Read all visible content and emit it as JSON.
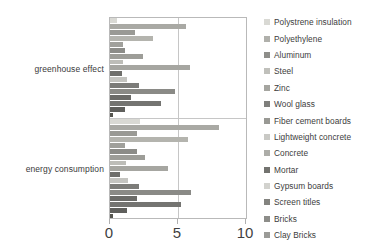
{
  "chart_data": {
    "type": "bar",
    "orientation": "horizontal",
    "title": "",
    "xlabel": "",
    "ylabel": "",
    "categories": [
      "greenhouse effect",
      "energy consumption"
    ],
    "xlim": [
      0,
      10
    ],
    "xticks": [
      0,
      5,
      10
    ],
    "xtick_labels": [
      "0",
      "5",
      "10"
    ],
    "grid": true,
    "legend_position": "right",
    "series": [
      {
        "name": "Polystrene insulation",
        "color": "#d9d9d4",
        "values": [
          0.55,
          2.2
        ]
      },
      {
        "name": "Polyethylene",
        "color": "#a9a9a4",
        "values": [
          5.6,
          8.0
        ]
      },
      {
        "name": "Aluminum",
        "color": "#9a9a95",
        "values": [
          1.85,
          1.95
        ]
      },
      {
        "name": "Steel",
        "color": "#b4b4ae",
        "values": [
          3.15,
          5.7
        ]
      },
      {
        "name": "Zinc",
        "color": "#a0a09b",
        "values": [
          0.95,
          1.1
        ]
      },
      {
        "name": "Wool glass",
        "color": "#8c8c88",
        "values": [
          1.1,
          1.95
        ]
      },
      {
        "name": "Fiber cement boards",
        "color": "#9d9d98",
        "values": [
          2.45,
          2.55
        ]
      },
      {
        "name": "Lightweight concrete",
        "color": "#bdbdb8",
        "values": [
          0.95,
          1.15
        ]
      },
      {
        "name": "Concrete",
        "color": "#a6a6a1",
        "values": [
          5.9,
          4.3
        ]
      },
      {
        "name": "Mortar",
        "color": "#6f6f6c",
        "values": [
          0.85,
          0.7
        ]
      },
      {
        "name": "Gypsum boards",
        "color": "#c4c4c0",
        "values": [
          1.25,
          1.35
        ]
      },
      {
        "name": "Screen titles",
        "color": "#7c7c79",
        "values": [
          2.1,
          2.1
        ]
      },
      {
        "name": "Bricks",
        "color": "#8a8a86",
        "values": [
          4.75,
          5.95
        ]
      },
      {
        "name": "Clay Bricks",
        "color": "#6b6b68",
        "values": [
          1.55,
          1.95
        ]
      }
    ],
    "extra_series": [
      {
        "name": "tail-1",
        "color": "#747471",
        "values": [
          3.75,
          5.2
        ]
      },
      {
        "name": "tail-2",
        "color": "#5f5f5c",
        "values": [
          1.1,
          1.25
        ]
      },
      {
        "name": "tail-3",
        "color": "#55554f",
        "values": [
          0.22,
          0.22
        ]
      }
    ]
  },
  "axis": {
    "x_ticks": [
      "0",
      "5",
      "10"
    ]
  },
  "y_categories": {
    "greenhouse": "greenhouse effect",
    "energy": "energy consumption"
  },
  "legend": {
    "items": [
      {
        "label": "Polystrene insulation",
        "color": "#d9d9d4"
      },
      {
        "label": "Polyethylene",
        "color": "#b0b0ab"
      },
      {
        "label": "Aluminum",
        "color": "#8e8e8a"
      },
      {
        "label": "Steel",
        "color": "#c0c0bb"
      },
      {
        "label": "Zinc",
        "color": "#a5a5a0"
      },
      {
        "label": "Wool glass",
        "color": "#7f7f7c"
      },
      {
        "label": "Fiber cement boards",
        "color": "#999994"
      },
      {
        "label": "Lightweight concrete",
        "color": "#c9c9c5"
      },
      {
        "label": "Concrete",
        "color": "#adadA8"
      },
      {
        "label": "Mortar",
        "color": "#73736f"
      },
      {
        "label": "Gypsum boards",
        "color": "#d2d2ce"
      },
      {
        "label": "Screen titles",
        "color": "#83837f"
      },
      {
        "label": "Bricks",
        "color": "#8d8d89"
      },
      {
        "label": "Clay Bricks",
        "color": "#9b9b97"
      }
    ]
  }
}
